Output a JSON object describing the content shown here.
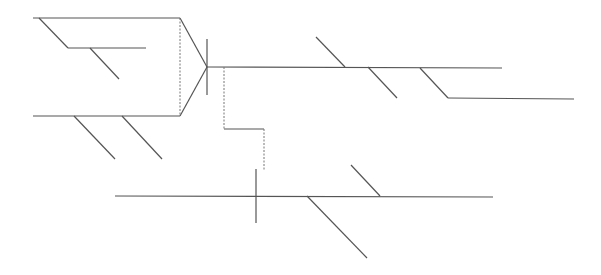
{
  "diagram": {
    "type": "line-drawing",
    "stroke_color": "#555555",
    "dotted_color": "#777777",
    "background": "#ffffff",
    "solid_lines": [
      {
        "id": "top-left-horizontal",
        "x1": 33,
        "y1": 18,
        "x2": 180,
        "y2": 18
      },
      {
        "id": "top-left-diagonal",
        "x1": 39,
        "y1": 18,
        "x2": 68,
        "y2": 48
      },
      {
        "id": "top-left-inner-horizontal",
        "x1": 68,
        "y1": 48,
        "x2": 146,
        "y2": 48
      },
      {
        "id": "top-left-inner-diagonal",
        "x1": 90,
        "y1": 48,
        "x2": 119,
        "y2": 79
      },
      {
        "id": "bottom-left-horizontal",
        "x1": 33,
        "y1": 116,
        "x2": 180,
        "y2": 116
      },
      {
        "id": "bottom-left-diagonal-1",
        "x1": 74,
        "y1": 116,
        "x2": 115,
        "y2": 159
      },
      {
        "id": "bottom-left-diagonal-2",
        "x1": 122,
        "y1": 116,
        "x2": 162,
        "y2": 159
      },
      {
        "id": "taper-upper",
        "x1": 180,
        "y1": 18,
        "x2": 207,
        "y2": 67
      },
      {
        "id": "taper-lower",
        "x1": 180,
        "y1": 116,
        "x2": 207,
        "y2": 67
      },
      {
        "id": "vertex-tick",
        "x1": 207,
        "y1": 39,
        "x2": 207,
        "y2": 95
      },
      {
        "id": "main-horizontal",
        "x1": 207,
        "y1": 67,
        "x2": 502,
        "y2": 68
      },
      {
        "id": "main-diagonal-1",
        "x1": 316,
        "y1": 37,
        "x2": 345,
        "y2": 67
      },
      {
        "id": "main-diagonal-2",
        "x1": 368,
        "y1": 67,
        "x2": 397,
        "y2": 98
      },
      {
        "id": "main-diagonal-3",
        "x1": 420,
        "y1": 68,
        "x2": 448,
        "y2": 98
      },
      {
        "id": "right-branch-horizontal",
        "x1": 448,
        "y1": 98,
        "x2": 574,
        "y2": 99
      },
      {
        "id": "step-horizontal",
        "x1": 224,
        "y1": 129,
        "x2": 264,
        "y2": 129
      },
      {
        "id": "bottom-horizontal",
        "x1": 115,
        "y1": 196,
        "x2": 493,
        "y2": 197
      },
      {
        "id": "bottom-tick",
        "x1": 256,
        "y1": 169,
        "x2": 256,
        "y2": 223
      },
      {
        "id": "bottom-diagonal-up",
        "x1": 351,
        "y1": 165,
        "x2": 380,
        "y2": 196
      },
      {
        "id": "bottom-diagonal-down",
        "x1": 307,
        "y1": 196,
        "x2": 367,
        "y2": 258
      }
    ],
    "dotted_lines": [
      {
        "id": "left-dotted-vertical",
        "x1": 180,
        "y1": 18,
        "x2": 180,
        "y2": 116
      },
      {
        "id": "step-dotted-vertical-1",
        "x1": 224,
        "y1": 67,
        "x2": 224,
        "y2": 129
      },
      {
        "id": "step-dotted-vertical-2",
        "x1": 264,
        "y1": 129,
        "x2": 264,
        "y2": 171
      }
    ]
  }
}
